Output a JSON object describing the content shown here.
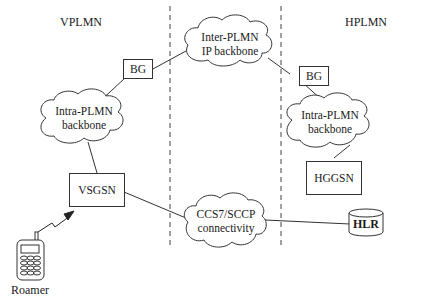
{
  "diagram": {
    "regions": {
      "visited": "VPLMN",
      "home": "HPLMN"
    },
    "clouds": {
      "inter_plmn": {
        "line1": "Inter-PLMN",
        "line2": "IP backbone"
      },
      "intra_visited": {
        "line1": "Intra-PLMN",
        "line2": "backbone"
      },
      "intra_home": {
        "line1": "Intra-PLMN",
        "line2": "backbone"
      },
      "ccs7": {
        "line1": "CCS7/SCCP",
        "line2": "connectivity"
      }
    },
    "nodes": {
      "bg_visited": "BG",
      "bg_home": "BG",
      "vsgsn": "VSGSN",
      "hggsn": "HGGSN",
      "hlr": "HLR"
    },
    "device": {
      "label": "Roamer",
      "icon": "mobile-phone-icon"
    },
    "connections": [
      {
        "from": "bg_visited",
        "to": "inter_plmn"
      },
      {
        "from": "inter_plmn",
        "to": "bg_home"
      },
      {
        "from": "bg_visited",
        "to": "intra_visited"
      },
      {
        "from": "bg_home",
        "to": "intra_home"
      },
      {
        "from": "intra_visited",
        "to": "vsgsn"
      },
      {
        "from": "intra_home",
        "to": "hggsn"
      },
      {
        "from": "vsgsn",
        "to": "ccs7"
      },
      {
        "from": "ccs7",
        "to": "hlr"
      },
      {
        "from": "roamer",
        "to": "vsgsn",
        "style": "radio-link"
      }
    ],
    "boundaries": [
      "dashed-left",
      "dashed-right"
    ]
  }
}
